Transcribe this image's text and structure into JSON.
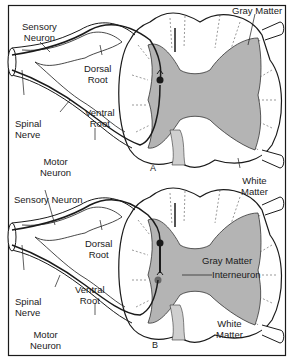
{
  "figure": {
    "colors": {
      "gray_matter": "#b4b4b4",
      "line": "#1a1a1a",
      "background": "#ffffff"
    },
    "panels": [
      {
        "id": "A",
        "letter": "A",
        "labels": {
          "sensory_neuron": "Sensory\nNeuron",
          "dorsal_root": "Dorsal\nRoot",
          "ventral_root": "Ventral\nRoot",
          "spinal_nerve": "Spinal\nNerve",
          "motor_neuron": "Motor\nNeuron",
          "gray_matter": "Gray Matter"
        }
      },
      {
        "id": "B",
        "letter": "B",
        "labels": {
          "white_matter_top": "White\nMatter",
          "sensory_neuron": "Sensory Neuron",
          "dorsal_root": "Dorsal\nRoot",
          "ventral_root": "Ventral\nRoot",
          "spinal_nerve": "Spinal\nNerve",
          "motor_neuron": "Motor\nNeuron",
          "gray_matter": "Gray Matter",
          "interneuron": "Interneuron",
          "white_matter_bottom": "White\nMatter"
        }
      }
    ]
  }
}
